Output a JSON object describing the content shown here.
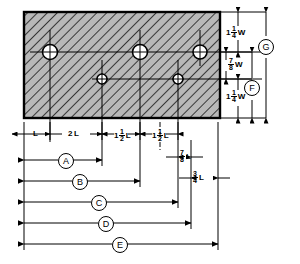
{
  "drawing": {
    "title": "Hole pattern layout plate detail",
    "type": "engineering-dimension-diagram",
    "plate": {
      "hatch": "45-degree-section-hatch",
      "x": 24,
      "y": 12,
      "width": 196,
      "height": 106
    },
    "holes": [
      {
        "name": "large-hole-1",
        "cx": 50,
        "cy": 52,
        "r": 7.5,
        "size": "large"
      },
      {
        "name": "large-hole-2",
        "cx": 140,
        "cy": 52,
        "r": 7.5,
        "size": "large"
      },
      {
        "name": "large-hole-3",
        "cx": 200,
        "cy": 52,
        "r": 7.0,
        "size": "large"
      },
      {
        "name": "small-hole-1",
        "cx": 102,
        "cy": 79,
        "r": 5.0,
        "size": "small"
      },
      {
        "name": "small-hole-2",
        "cx": 178,
        "cy": 79,
        "r": 5.0,
        "size": "small"
      }
    ],
    "vertical_dimensions": [
      {
        "id": "top-edge-margin",
        "whole": "1",
        "num": "1",
        "den": "4",
        "unit": "W"
      },
      {
        "id": "hole-row-spacing",
        "whole": "",
        "num": "7",
        "den": "8",
        "unit": "W"
      },
      {
        "id": "bottom-edge-margin",
        "whole": "1",
        "num": "1",
        "den": "4",
        "unit": "W"
      }
    ],
    "vertical_balloons": [
      {
        "id": "balloon-F",
        "label": "F"
      },
      {
        "id": "balloon-G",
        "label": "G"
      }
    ],
    "horizontal_chain": [
      {
        "id": "dim-L",
        "whole": "",
        "num": "",
        "den": "",
        "unit": "L"
      },
      {
        "id": "dim-2L",
        "whole": "2",
        "num": "",
        "den": "",
        "unit": "L"
      },
      {
        "id": "dim-1-1-2L",
        "whole": "1",
        "num": "1",
        "den": "2",
        "unit": "L"
      },
      {
        "id": "dim-1-1-2L-b",
        "whole": "1",
        "num": "1",
        "den": "2",
        "unit": "L"
      }
    ],
    "offset_dimensions": [
      {
        "id": "dim-7-8L",
        "whole": "",
        "num": "7",
        "den": "8",
        "unit": "L"
      },
      {
        "id": "dim-3-4L",
        "whole": "",
        "num": "3",
        "den": "4",
        "unit": "L"
      }
    ],
    "horizontal_balloons": [
      {
        "id": "balloon-A",
        "label": "A",
        "y": 160,
        "x1": 24,
        "x2": 102
      },
      {
        "id": "balloon-B",
        "label": "B",
        "y": 181,
        "x1": 24,
        "x2": 140
      },
      {
        "id": "balloon-C",
        "label": "C",
        "y": 202,
        "x1": 24,
        "x2": 178
      },
      {
        "id": "balloon-D",
        "label": "D",
        "y": 223,
        "x1": 24,
        "x2": 191
      },
      {
        "id": "balloon-E",
        "label": "E",
        "y": 244,
        "x1": 24,
        "x2": 218
      }
    ],
    "colors": {
      "line": "#000000",
      "plate_fill": "#b3b3b3",
      "hole_fill": "#ffffff",
      "background": "#ffffff"
    }
  }
}
